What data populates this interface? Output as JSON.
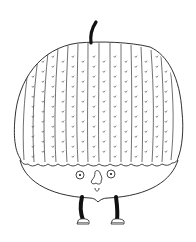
{
  "illustration": {
    "subject": "acorn-character",
    "style": "black line art on white",
    "colors": {
      "background": "#ffffff",
      "line": "#1a1a1a",
      "fill": "#ffffff",
      "legs": "#111111"
    },
    "parts": [
      "stem",
      "ribbed-cap",
      "face-body",
      "eyes",
      "nose",
      "mouth",
      "legs",
      "shoes"
    ]
  }
}
